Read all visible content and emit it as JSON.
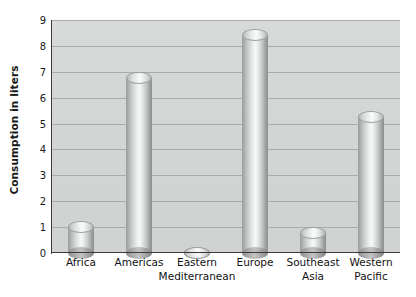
{
  "chart_data": {
    "type": "bar",
    "title": "",
    "subtitle": "",
    "xlabel": "",
    "ylabel": "Consumption in liters",
    "categories": [
      "Africa",
      "Americas",
      "Eastern\nMediterranean",
      "Europe",
      "Southeast\nAsia",
      "Western\nPacific"
    ],
    "values": [
      1.25,
      7.0,
      0.25,
      8.65,
      1.0,
      5.5
    ],
    "ylim": [
      0,
      9
    ],
    "yticks": [
      0,
      1,
      2,
      3,
      4,
      5,
      6,
      7,
      8,
      9
    ],
    "ytick_labels": [
      "0",
      "1",
      "2",
      "3",
      "4",
      "5",
      "6",
      "7",
      "8",
      "9"
    ],
    "grid": "horizontal",
    "legend": "none",
    "style": "3d-cylinder-bars",
    "colors": {
      "plot_background": "#d4d5d5",
      "gridline": "#a9abab",
      "axis": "#3b3b3b",
      "bar_light": "#f6f7f7",
      "bar_dark": "#8e9090",
      "text": "#1a1a1a",
      "page_background": "#ffffff"
    }
  }
}
